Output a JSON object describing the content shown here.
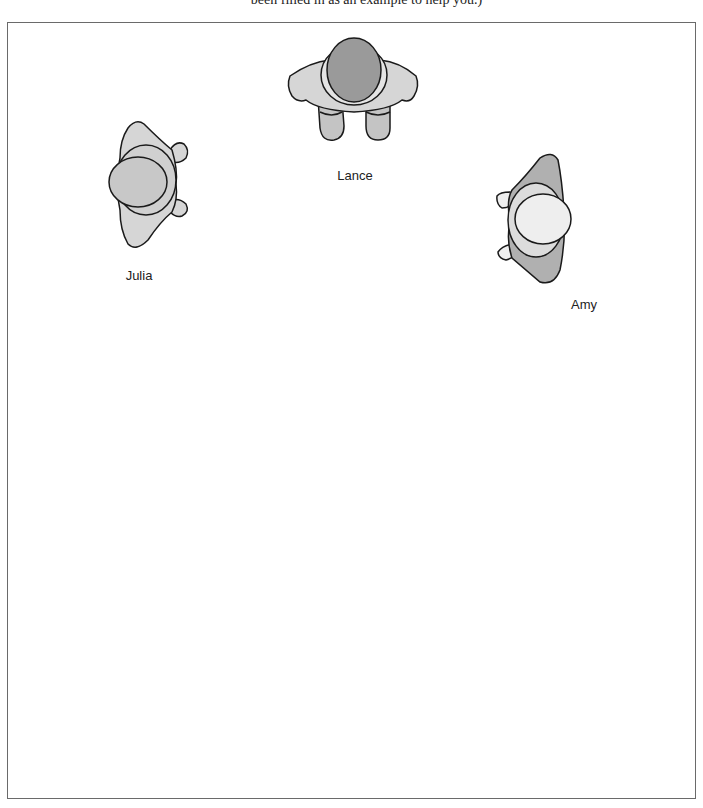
{
  "caption": "been filled in as an example to help you.)",
  "figures": {
    "lance": {
      "label": "Lance",
      "orientation": "facing down"
    },
    "julia": {
      "label": "Julia",
      "orientation": "facing left"
    },
    "amy": {
      "label": "Amy",
      "orientation": "facing right"
    }
  },
  "colors": {
    "body_light": "#d6d6d6",
    "body_mid": "#b0b0b0",
    "head_dark": "#9a9a9a",
    "head_light": "#e8e8e8",
    "outline": "#1a1a1a",
    "frame_border": "#6a6a6a"
  }
}
